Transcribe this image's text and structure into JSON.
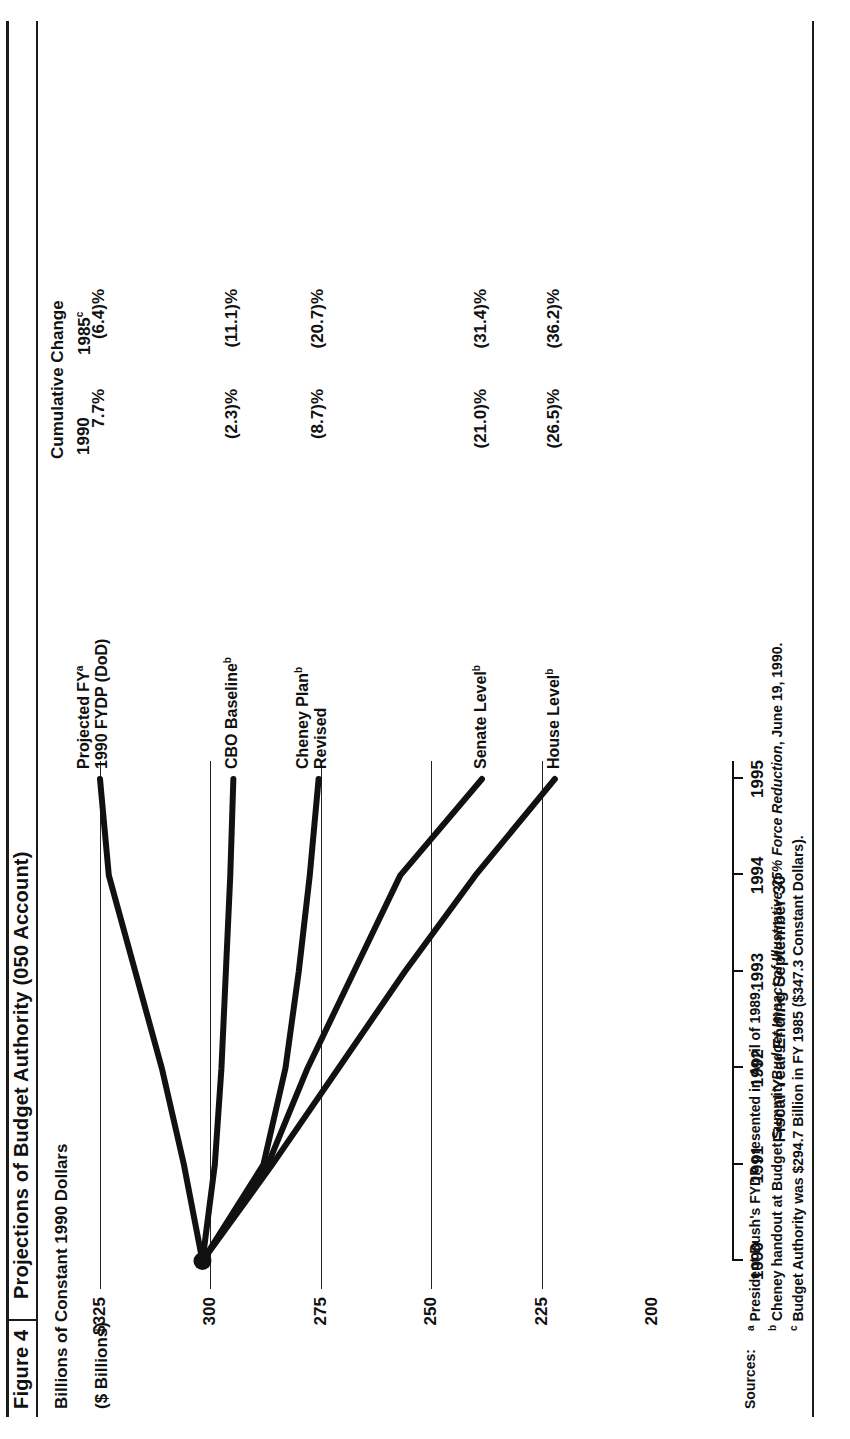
{
  "figure": {
    "label": "Figure 4",
    "title": "Projections of Budget Authority (050 Account)",
    "subtitle": "Billions of Constant 1990 Dollars",
    "units": "($ Billions)"
  },
  "table": {
    "header_line1": "Cumulative Change",
    "header_col_1990": "1990",
    "header_col_1985": "1985",
    "header_col_1985_sup": "c",
    "rows": [
      {
        "v1990": "7.7%",
        "v1985": "(6.4)%"
      },
      {
        "v1990": "(2.3)%",
        "v1985": "(11.1)%"
      },
      {
        "v1990": "(8.7)%",
        "v1985": "(20.7)%"
      },
      {
        "v1990": "(21.0)%",
        "v1985": "(31.4)%"
      },
      {
        "v1990": "(26.5)%",
        "v1985": "(36.2)%"
      }
    ]
  },
  "sources": {
    "label": "Sources:",
    "notes": [
      {
        "marker": "a",
        "pre": "President Bush's FYDP presented in April of 1989.",
        "em": "",
        "post": ""
      },
      {
        "marker": "b",
        "pre": "Cheney handout at Budget Summit, ",
        "em": "Budget Impact of Illustrative 25% Force Reduction",
        "post": ", June 19, 1990."
      },
      {
        "marker": "c",
        "pre": "Budget Authority was $294.7 Billion in FY 1985 ($347.3 Constant Dollars).",
        "em": "",
        "post": ""
      }
    ]
  },
  "chart_data": {
    "type": "line",
    "title": "Projections of Budget Authority (050 Account)",
    "subtitle": "Billions of Constant 1990 Dollars",
    "xlabel": "Fiscal Year Ending September 30",
    "ylabel": "($ Billions)",
    "x": [
      1990,
      1991,
      1992,
      1993,
      1994,
      1995
    ],
    "xticks": [
      "1990",
      "1991",
      "1992",
      "1993",
      "1994",
      "1995"
    ],
    "yticks": [
      "$325",
      "300",
      "275",
      "250",
      "225",
      "200"
    ],
    "ytick_values": [
      325,
      300,
      275,
      250,
      225,
      200
    ],
    "ylim": [
      200,
      332
    ],
    "xlim": [
      1990,
      1995
    ],
    "grid": "horizontal",
    "legend": "inline-end-labels",
    "marker_note": "all series converge to a single filled dot at 1990 = 301.8",
    "series": [
      {
        "name": "Projected FY",
        "name_sup": "a",
        "name_line2": "1990 FYDP (DoD)",
        "label_full": "Projected FYᵃ 1990 FYDP (DoD)",
        "values": [
          301.8,
          306.0,
          311.0,
          317.0,
          323.0,
          325.0
        ],
        "cum_1990": "7.7%",
        "cum_1985": "(6.4)%"
      },
      {
        "name": "CBO Baseline",
        "name_sup": "b",
        "label_full": "CBO Baselineᵇ",
        "values": [
          301.8,
          299.0,
          297.5,
          296.5,
          295.5,
          294.8
        ],
        "cum_1990": "(2.3)%",
        "cum_1985": "(11.1)%"
      },
      {
        "name": "Cheney Plan",
        "name_sup": "b",
        "name_line2": "Revised",
        "label_full": "Cheney Planᵇ Revised",
        "values": [
          301.8,
          288.0,
          283.0,
          280.0,
          277.5,
          275.5
        ],
        "cum_1990": "(8.7)%",
        "cum_1985": "(20.7)%"
      },
      {
        "name": "Senate Level",
        "name_sup": "b",
        "label_full": "Senate Levelᵇ",
        "values": [
          301.8,
          287.0,
          278.0,
          267.5,
          257.0,
          238.5
        ],
        "cum_1990": "(21.0)%",
        "cum_1985": "(31.4)%"
      },
      {
        "name": "House Level",
        "name_sup": "b",
        "label_full": "House Levelᵇ",
        "values": [
          301.8,
          286.0,
          271.0,
          256.0,
          240.0,
          222.0
        ],
        "cum_1990": "(26.5)%",
        "cum_1985": "(36.2)%"
      }
    ]
  }
}
